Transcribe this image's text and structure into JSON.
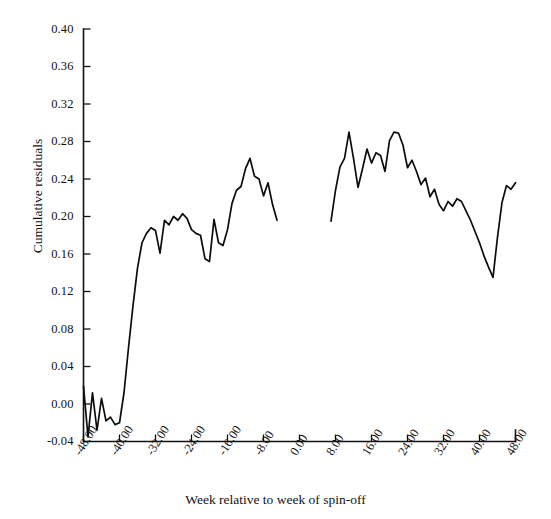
{
  "chart_data": {
    "type": "line",
    "title": "",
    "subtitle": "",
    "xlabel": "Week relative to week of spin-off",
    "ylabel": "Cumulative residuals",
    "xlim": [
      -48,
      48
    ],
    "ylim": [
      -0.04,
      0.4
    ],
    "grid": false,
    "legend": null,
    "xticks": [
      -48,
      -40,
      -32,
      -24,
      -16,
      -8,
      0,
      8,
      16,
      24,
      32,
      40,
      48
    ],
    "xtick_labels": [
      "-48.00",
      "-40.00",
      "-32.00",
      "-24.00",
      "-16.00",
      "-8.00",
      "0.00",
      "8.00",
      "16.00",
      "24.00",
      "32.00",
      "40.00",
      "48.00"
    ],
    "yticks": [
      -0.04,
      0.0,
      0.04,
      0.08,
      0.12,
      0.16,
      0.2,
      0.24,
      0.28,
      0.32,
      0.36,
      0.4
    ],
    "ytick_labels": [
      "-0.04",
      "0.00",
      "0.04",
      "0.08",
      "0.12",
      "0.16",
      "0.20",
      "0.24",
      "0.28",
      "0.32",
      "0.36",
      "0.40"
    ],
    "line_color": "#0c0c0c",
    "series": [
      {
        "name": "Cumulative residuals (pre-spin-off)",
        "x": [
          -48,
          -47,
          -46,
          -45,
          -44,
          -43,
          -42,
          -41,
          -40,
          -39,
          -38,
          -37,
          -36,
          -35,
          -34,
          -33,
          -32,
          -31,
          -30,
          -29,
          -28,
          -27,
          -26,
          -25,
          -24,
          -23,
          -22,
          -21,
          -20,
          -19,
          -18,
          -17,
          -16,
          -15,
          -14,
          -13,
          -12,
          -11,
          -10,
          -9,
          -8,
          -7,
          -6,
          -5
        ],
        "values": [
          0.019,
          -0.035,
          0.012,
          -0.028,
          0.006,
          -0.018,
          -0.014,
          -0.022,
          -0.02,
          0.012,
          0.06,
          0.105,
          0.145,
          0.172,
          0.182,
          0.188,
          0.185,
          0.161,
          0.196,
          0.191,
          0.2,
          0.196,
          0.203,
          0.198,
          0.186,
          0.182,
          0.18,
          0.155,
          0.152,
          0.197,
          0.172,
          0.169,
          0.186,
          0.214,
          0.228,
          0.232,
          0.251,
          0.262,
          0.243,
          0.24,
          0.222,
          0.236,
          0.213,
          0.196
        ]
      },
      {
        "name": "Cumulative residuals (post-spin-off)",
        "x": [
          7,
          8,
          9,
          10,
          11,
          12,
          13,
          14,
          15,
          16,
          17,
          18,
          19,
          20,
          21,
          22,
          23,
          24,
          25,
          26,
          27,
          28,
          29,
          30,
          31,
          32,
          33,
          34,
          35,
          36,
          37,
          38,
          39,
          40,
          41,
          42,
          43,
          44,
          45,
          46,
          47,
          48
        ],
        "values": [
          0.195,
          0.228,
          0.253,
          0.262,
          0.29,
          0.262,
          0.231,
          0.251,
          0.272,
          0.257,
          0.268,
          0.265,
          0.248,
          0.281,
          0.29,
          0.289,
          0.276,
          0.252,
          0.26,
          0.248,
          0.234,
          0.241,
          0.221,
          0.229,
          0.213,
          0.206,
          0.216,
          0.211,
          0.219,
          0.216,
          0.206,
          0.196,
          0.184,
          0.172,
          0.158,
          0.146,
          0.135,
          0.178,
          0.215,
          0.233,
          0.229,
          0.236
        ]
      }
    ]
  },
  "axes": {
    "y_axis_name": "y-axis",
    "x_axis_name": "x-axis"
  }
}
